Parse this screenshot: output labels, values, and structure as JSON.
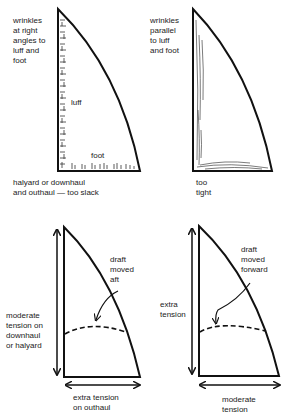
{
  "panels": [
    {
      "id": "slack",
      "note": "wrinkles\nat right\nangles to\nluff and\nfoot",
      "luff_label": "luff",
      "foot_label": "foot",
      "caption": "halyard or downhaul\nand outhaul — too slack"
    },
    {
      "id": "tight",
      "note": "wrinkles\nparallel\nto luff\nand foot",
      "caption": "too\ntight"
    },
    {
      "id": "draft-aft",
      "draft_note": "draft\nmoved\naft",
      "luff_tension": "moderate\ntension on\ndownhaul\nor halyard",
      "foot_tension": "extra tension\non outhaul"
    },
    {
      "id": "draft-forward",
      "draft_note": "draft\nmoved\nforward",
      "luff_tension": "extra\ntension",
      "foot_tension": "moderate\ntension"
    }
  ],
  "colors": {
    "ink": "#111111",
    "background": "#ffffff"
  }
}
